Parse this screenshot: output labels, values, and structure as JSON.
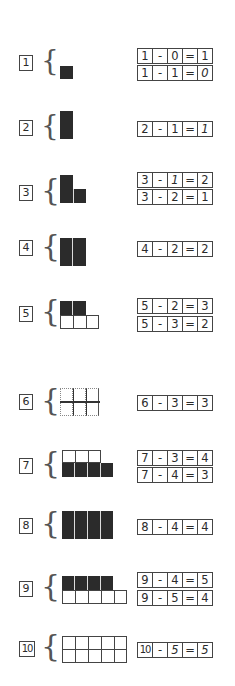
{
  "worksheet": {
    "rows": [
      {
        "label": "1",
        "equations": [
          [
            "1",
            "-",
            "0",
            "=",
            "1"
          ],
          [
            "1",
            "-",
            "1",
            "=",
            "0"
          ]
        ]
      },
      {
        "label": "2",
        "equations": [
          [
            "2",
            "-",
            "1",
            "=",
            "1"
          ]
        ]
      },
      {
        "label": "3",
        "equations": [
          [
            "3",
            "-",
            "1",
            "=",
            "2"
          ],
          [
            "3",
            "-",
            "2",
            "=",
            "1"
          ]
        ]
      },
      {
        "label": "4",
        "equations": [
          [
            "4",
            "-",
            "2",
            "=",
            "2"
          ]
        ]
      },
      {
        "label": "5",
        "equations": [
          [
            "5",
            "-",
            "2",
            "=",
            "3"
          ],
          [
            "5",
            "-",
            "3",
            "=",
            "2"
          ]
        ]
      },
      {
        "label": "6",
        "equations": [
          [
            "6",
            "-",
            "3",
            "=",
            "3"
          ]
        ]
      },
      {
        "label": "7",
        "equations": [
          [
            "7",
            "-",
            "3",
            "=",
            "4"
          ],
          [
            "7",
            "-",
            "4",
            "=",
            "3"
          ]
        ]
      },
      {
        "label": "8",
        "equations": [
          [
            "8",
            "-",
            "4",
            "=",
            "4"
          ]
        ]
      },
      {
        "label": "9",
        "equations": [
          [
            "9",
            "-",
            "4",
            "=",
            "5"
          ],
          [
            "9",
            "-",
            "5",
            "=",
            "4"
          ]
        ]
      },
      {
        "label": "10",
        "equations": [
          [
            "10",
            "-",
            "5",
            "=",
            "5"
          ]
        ]
      }
    ],
    "brace_glyph": "{",
    "colors": {
      "ink": "#2b2b2b",
      "paper": "#ffffff"
    }
  }
}
